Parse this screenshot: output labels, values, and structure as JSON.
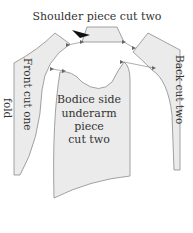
{
  "diagram": {
    "title": "Shoulder piece  cut two",
    "pieces": {
      "shoulder": {
        "label": "Shoulder piece  cut two"
      },
      "front": {
        "label": "Front  cut one",
        "fold_label": "fold"
      },
      "back": {
        "label": "Back  cut two"
      },
      "bodice_side": {
        "line1": "Bodice side",
        "line2": "underarm",
        "line3": "piece",
        "line4": "cut two"
      }
    },
    "colors": {
      "piece_fill": "#ebebeb",
      "outline": "#8a8a8a",
      "text": "#333333",
      "arrow": "#111111"
    }
  }
}
